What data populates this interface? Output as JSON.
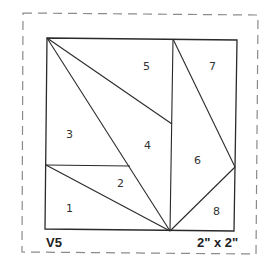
{
  "diagram": {
    "title": "V5",
    "size_label": "2\" x 2\"",
    "colors": {
      "line": "#2a2a2a",
      "dashed_border": "#8a8a8a",
      "background": "#ffffff"
    },
    "pieces": [
      {
        "id": 1,
        "label": "1"
      },
      {
        "id": 2,
        "label": "2"
      },
      {
        "id": 3,
        "label": "3"
      },
      {
        "id": 4,
        "label": "4"
      },
      {
        "id": 5,
        "label": "5"
      },
      {
        "id": 6,
        "label": "6"
      },
      {
        "id": 7,
        "label": "7"
      },
      {
        "id": 8,
        "label": "8"
      }
    ]
  }
}
